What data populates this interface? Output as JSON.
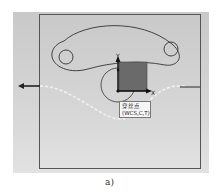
{
  "figure": {
    "caption": "a)",
    "label": {
      "line1": "穿丝点",
      "line2": "(WCS,C,T)"
    },
    "axes": {
      "x_label": "X",
      "y_label": "Y"
    },
    "colors": {
      "background": "#d0d0d0",
      "outline": "#555555",
      "square_fill": "#6a6a6a",
      "path_dashed": "#f0f0f0"
    }
  }
}
